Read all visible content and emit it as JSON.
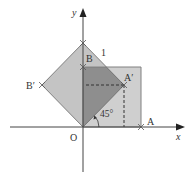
{
  "diagram": {
    "type": "coordinate-geometry",
    "axes": {
      "x_label": "x",
      "y_label": "y",
      "origin_label": "O"
    },
    "points": {
      "A": {
        "label": "A"
      },
      "B": {
        "label": "B"
      },
      "A_prime": {
        "label": "A′"
      },
      "B_prime": {
        "label": "B′"
      },
      "top": {
        "label": "1"
      }
    },
    "angle": {
      "label": "45°"
    },
    "colors": {
      "square_fill": "#c8c8c8",
      "rotated_fill": "#c0c0c0",
      "overlap_fill": "#8c8c8c",
      "edge": "#7a7a7a",
      "axis": "#444444"
    }
  }
}
